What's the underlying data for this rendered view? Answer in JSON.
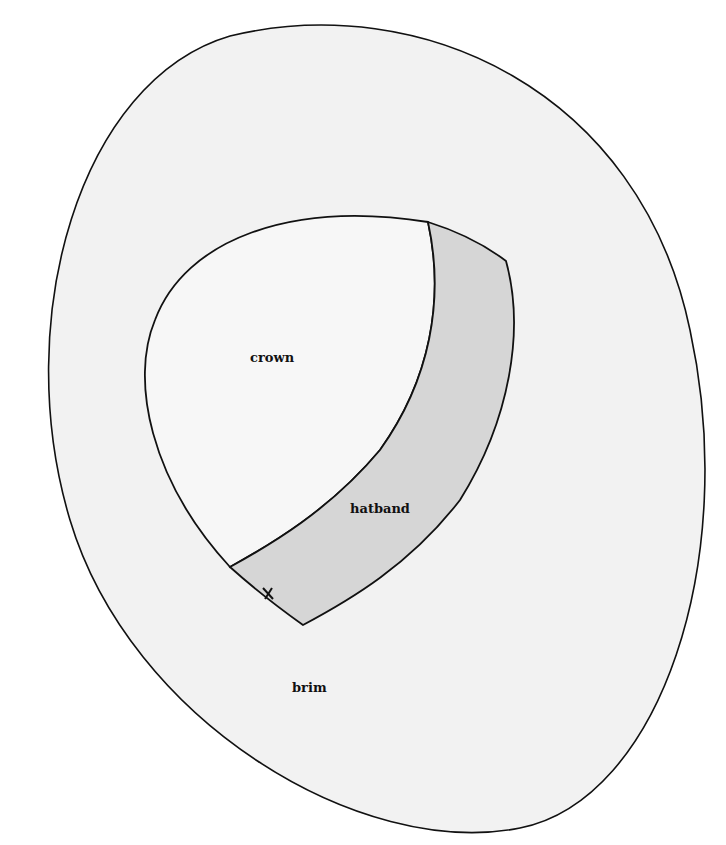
{
  "diagram": {
    "labels": {
      "crown": "crown",
      "hatband": "hatband",
      "brim": "brim"
    },
    "marker": "x",
    "colors": {
      "background": "#ffffff",
      "brim_fill": "#f2f2f2",
      "crown_fill": "#f7f7f7",
      "hatband_fill": "#d6d6d6",
      "stroke": "#111111"
    }
  }
}
